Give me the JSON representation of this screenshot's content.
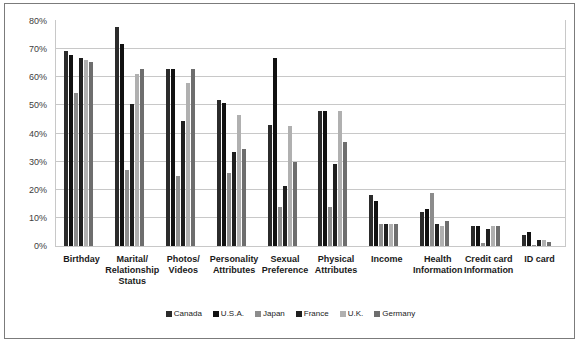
{
  "chart_data": {
    "type": "bar",
    "title": "Individual Information",
    "xlabel": "",
    "ylabel": "",
    "ylim": [
      0,
      80
    ],
    "ytick_labels": [
      "80%",
      "70%",
      "60%",
      "50%",
      "40%",
      "30%",
      "20%",
      "10%",
      "0%"
    ],
    "ytick_values": [
      80,
      70,
      60,
      50,
      40,
      30,
      20,
      10,
      0
    ],
    "grid": true,
    "legend_position": "bottom",
    "categories": [
      "Birthday",
      "Marital/ Relationship Status",
      "Photos/ Videos",
      "Personality Attributes",
      "Sexual Preference",
      "Physical Attributes",
      "Income",
      "Health Information",
      "Credit card Information",
      "ID card"
    ],
    "category_lines": [
      [
        "Birthday"
      ],
      [
        "Marital/",
        "Relationship",
        "Status"
      ],
      [
        "Photos/",
        "Videos"
      ],
      [
        "Personality",
        "Attributes"
      ],
      [
        "Sexual",
        "Preference"
      ],
      [
        "Physical",
        "Attributes"
      ],
      [
        "Income"
      ],
      [
        "Health",
        "Information"
      ],
      [
        "Credit card",
        "Information"
      ],
      [
        "ID card"
      ]
    ],
    "series": [
      {
        "name": "Canada",
        "color": "#2b2b2b",
        "values": [
          69.5,
          78,
          63,
          52,
          43,
          48,
          18,
          12,
          7,
          4
        ]
      },
      {
        "name": "U.S.A.",
        "color": "#111111",
        "values": [
          68,
          72,
          63,
          51,
          67,
          48,
          16,
          13,
          7,
          5
        ]
      },
      {
        "name": "Japan",
        "color": "#8c8c8c",
        "values": [
          54.5,
          27,
          25,
          26,
          14,
          14,
          8,
          19,
          1,
          0.5
        ]
      },
      {
        "name": "France",
        "color": "#1f1f1f",
        "values": [
          67,
          50.5,
          44.5,
          33.5,
          21.5,
          29,
          8,
          8,
          6,
          2
        ]
      },
      {
        "name": "U.K.",
        "color": "#b0b0b0",
        "values": [
          66,
          61,
          58,
          46.5,
          42.5,
          48,
          8,
          7,
          7,
          2
        ]
      },
      {
        "name": "Germany",
        "color": "#6e6e6e",
        "values": [
          65.5,
          63,
          63,
          34.5,
          30,
          37,
          8,
          9,
          7,
          1.5
        ]
      }
    ]
  }
}
